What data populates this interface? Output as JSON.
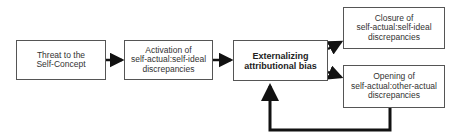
{
  "diagram": {
    "nodes": [
      {
        "id": "threat",
        "label": "Threat to the\nSelf-Concept"
      },
      {
        "id": "activation",
        "label": "Activation of\nself-actual:self-ideal\ndiscrepancies"
      },
      {
        "id": "externalizing",
        "label": "Externalizing\nattributional bias"
      },
      {
        "id": "closure",
        "label": "Closure of\nself-actual:self-ideal\ndiscrepancies"
      },
      {
        "id": "opening",
        "label": "Opening of\nself-actual:other-actual\ndiscrepancies"
      }
    ],
    "edges": [
      {
        "from": "threat",
        "to": "activation"
      },
      {
        "from": "activation",
        "to": "externalizing"
      },
      {
        "from": "externalizing",
        "to": "closure"
      },
      {
        "from": "externalizing",
        "to": "opening"
      },
      {
        "from": "opening",
        "to": "externalizing",
        "type": "feedback"
      }
    ]
  }
}
